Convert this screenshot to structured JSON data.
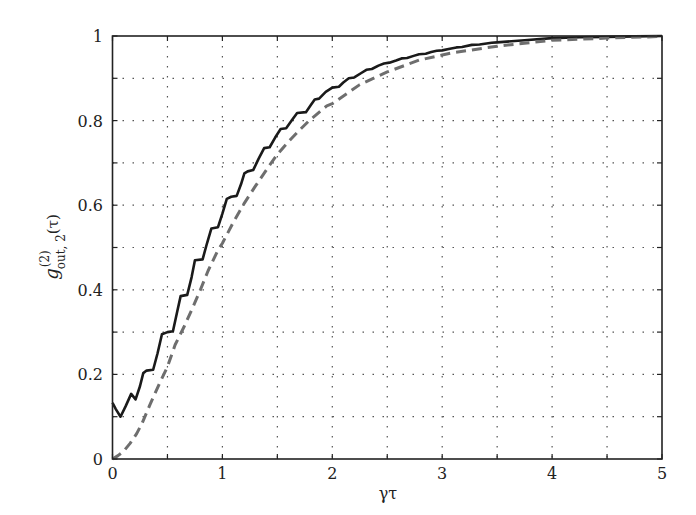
{
  "chart_data": {
    "type": "line",
    "title": "",
    "xlabel": "γτ",
    "ylabel": "g(2)out,2(τ)",
    "ylabel_parts": {
      "base": "g",
      "sup": "(2)",
      "sub": "out, 2",
      "arg": "(τ)"
    },
    "xlim": [
      0,
      5
    ],
    "ylim": [
      0,
      1
    ],
    "xticks": [
      0,
      1,
      2,
      3,
      4,
      5
    ],
    "xtick_labels": [
      "0",
      "1",
      "2",
      "3",
      "4",
      "5"
    ],
    "yticks": [
      0,
      0.2,
      0.4,
      0.6,
      0.8,
      1
    ],
    "ytick_labels": [
      "0",
      "0.2",
      "0.4",
      "0.6",
      "0.8",
      "1"
    ],
    "grid": {
      "on": true,
      "style": "dotted",
      "x_step": 0.5,
      "y_step": 0.1
    },
    "legend": null,
    "series": [
      {
        "name": "oscillating (solid)",
        "style": "solid",
        "color": "#1a1a1a",
        "x": [
          0,
          0.03,
          0.073,
          0.12,
          0.17,
          0.21,
          0.25,
          0.28,
          0.31,
          0.37,
          0.41,
          0.45,
          0.5,
          0.55,
          0.59,
          0.62,
          0.68,
          0.72,
          0.75,
          0.82,
          0.86,
          0.9,
          0.96,
          1.0,
          1.04,
          1.08,
          1.13,
          1.17,
          1.2,
          1.23,
          1.28,
          1.33,
          1.38,
          1.43,
          1.48,
          1.53,
          1.58,
          1.63,
          1.68,
          1.76,
          1.8,
          1.84,
          1.88,
          1.94,
          2.0,
          2.06,
          2.1,
          2.15,
          2.2,
          2.26,
          2.31,
          2.36,
          2.42,
          2.47,
          2.52,
          2.58,
          2.63,
          2.68,
          2.74,
          2.79,
          2.85,
          2.9,
          2.95,
          3.0,
          3.07,
          3.13,
          3.18,
          3.27,
          3.34,
          3.45,
          3.5,
          3.75,
          4.0,
          4.25,
          4.5,
          4.75,
          5.0
        ],
        "y": [
          0.133,
          0.118,
          0.1,
          0.125,
          0.154,
          0.141,
          0.172,
          0.203,
          0.209,
          0.211,
          0.25,
          0.295,
          0.3,
          0.302,
          0.35,
          0.385,
          0.388,
          0.43,
          0.47,
          0.472,
          0.51,
          0.545,
          0.548,
          0.58,
          0.615,
          0.62,
          0.622,
          0.65,
          0.675,
          0.68,
          0.683,
          0.71,
          0.735,
          0.737,
          0.76,
          0.78,
          0.782,
          0.8,
          0.818,
          0.82,
          0.835,
          0.85,
          0.852,
          0.868,
          0.878,
          0.88,
          0.89,
          0.9,
          0.902,
          0.912,
          0.92,
          0.922,
          0.93,
          0.935,
          0.937,
          0.942,
          0.947,
          0.948,
          0.953,
          0.957,
          0.958,
          0.962,
          0.965,
          0.966,
          0.97,
          0.973,
          0.974,
          0.979,
          0.98,
          0.984,
          0.985,
          0.99,
          0.995,
          0.997,
          0.998,
          0.999,
          1.0
        ]
      },
      {
        "name": "smooth (dashed)",
        "style": "dashed",
        "color": "#6e6e6e",
        "x": [
          0,
          0.05,
          0.1,
          0.16,
          0.22,
          0.27,
          0.34,
          0.43,
          0.5,
          0.57,
          0.65,
          0.72,
          0.8,
          0.87,
          0.96,
          1.0,
          1.1,
          1.2,
          1.3,
          1.43,
          1.5,
          1.6,
          1.7,
          1.79,
          1.95,
          2.0,
          2.25,
          2.5,
          2.79,
          3.0,
          3.09,
          3.5,
          4.0,
          4.5,
          5.0
        ],
        "y": [
          0.0,
          0.008,
          0.018,
          0.037,
          0.06,
          0.085,
          0.128,
          0.18,
          0.218,
          0.27,
          0.312,
          0.352,
          0.4,
          0.445,
          0.494,
          0.51,
          0.56,
          0.605,
          0.645,
          0.695,
          0.72,
          0.75,
          0.777,
          0.8,
          0.835,
          0.84,
          0.885,
          0.915,
          0.943,
          0.955,
          0.96,
          0.976,
          0.99,
          0.995,
          0.999
        ]
      }
    ]
  }
}
